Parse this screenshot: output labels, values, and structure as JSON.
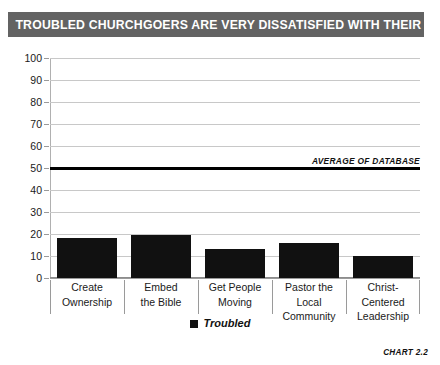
{
  "title": "TROUBLED CHURCHGOERS ARE VERY DISSATISFIED WITH THEIR CHURCH",
  "chart_number": "CHART 2.2",
  "legend": {
    "entries": [
      {
        "label": "Troubled",
        "color": "#111111",
        "marker": "square"
      }
    ]
  },
  "annotations": [
    {
      "label": "AVERAGE OF DATABASE",
      "value": 50
    }
  ],
  "colors": {
    "banner_background": "#636363",
    "banner_text": "#ffffff",
    "bar": "#111111",
    "gridline": "#c8c8c8",
    "axis": "#9a9a9a",
    "text": "#1a1a1a"
  },
  "chart_data": {
    "type": "bar",
    "title": "TROUBLED CHURCHGOERS ARE VERY DISSATISFIED WITH THEIR CHURCH",
    "xlabel": "",
    "ylabel": "",
    "ylim": [
      0,
      100
    ],
    "yticks": [
      0,
      10,
      20,
      30,
      40,
      50,
      60,
      70,
      80,
      90,
      100
    ],
    "ytick_labels": [
      "0",
      "10",
      "20",
      "30",
      "40",
      "50",
      "60",
      "70",
      "80",
      "90",
      "100"
    ],
    "grid": true,
    "legend_position": "bottom-center",
    "categories": [
      "Create\nOwnership",
      "Embed\nthe Bible",
      "Get People\nMoving",
      "Pastor the Local\nCommunity",
      "Christ-Centered\nLeadership"
    ],
    "category_lines": [
      [
        "Create",
        "Ownership"
      ],
      [
        "Embed",
        "the Bible"
      ],
      [
        "Get People",
        "Moving"
      ],
      [
        "Pastor the Local",
        "Community"
      ],
      [
        "Christ-Centered",
        "Leadership"
      ]
    ],
    "series": [
      {
        "name": "Troubled",
        "color": "#111111",
        "values": [
          18,
          19.5,
          13,
          16,
          10
        ]
      }
    ],
    "reference_lines": [
      {
        "label": "AVERAGE OF DATABASE",
        "value": 50,
        "color": "#000000"
      }
    ]
  }
}
